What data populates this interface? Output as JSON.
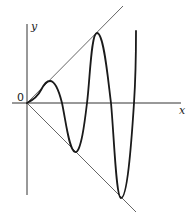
{
  "diagram": {
    "title": "",
    "axes": {
      "x_label": "x",
      "y_label": "y",
      "origin_label": "0"
    },
    "curves": [
      {
        "name": "oscillating-curve",
        "description": "oscillation with growing amplitude bounded by two lines through origin"
      },
      {
        "name": "upper-envelope-line",
        "description": "line y = x"
      },
      {
        "name": "lower-envelope-line",
        "description": "line y = -x"
      }
    ],
    "colors": {
      "curve": "#1a1a1a",
      "envelope": "#555555",
      "axis": "#333333",
      "background": "#ffffff"
    }
  }
}
